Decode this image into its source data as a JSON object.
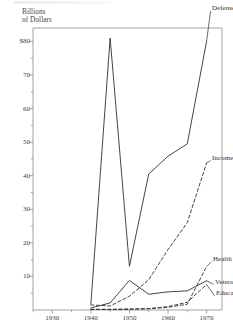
{
  "figure": {
    "axis_title": "Billions\nof Dollars",
    "frame_color": "#8a8a8a",
    "line_color": "#2f2f2f"
  },
  "chart_data": {
    "type": "line",
    "title": "",
    "subtitle": "",
    "xlabel": "",
    "ylabel": "Billions of Dollars",
    "xlim": [
      1925,
      1974
    ],
    "ylim": [
      0,
      84
    ],
    "grid": false,
    "legend_position": "right-inline",
    "x_ticks_major": [
      1930,
      1940,
      1950,
      1960,
      1970
    ],
    "x_ticks_minor": [
      1925,
      1935,
      1945,
      1955,
      1965
    ],
    "x_tick_labels": [
      "1930",
      "1940",
      "1950",
      "1960",
      "1970"
    ],
    "y_ticks": [
      10,
      20,
      30,
      40,
      50,
      60,
      70,
      80
    ],
    "y_tick_labels": [
      "10",
      "20",
      "30",
      "40",
      "50",
      "$80"
    ],
    "y_tick_labels_full": [
      "10",
      "20",
      "30",
      "40",
      "50",
      "60",
      "70",
      "$80"
    ],
    "y_ticks_minor": [
      5,
      15,
      25,
      35,
      45,
      55,
      65,
      75
    ],
    "series": [
      {
        "name": "Defense",
        "style": "solid",
        "label": "Defense",
        "x": [
          1940,
          1945,
          1950,
          1955,
          1960,
          1965,
          1970
        ],
        "values": [
          1.7,
          81.0,
          13.0,
          40.5,
          45.8,
          49.5,
          80.0
        ]
      },
      {
        "name": "Income Security",
        "style": "dashed",
        "label": "Income Security",
        "x": [
          1940,
          1945,
          1950,
          1955,
          1960,
          1965,
          1970
        ],
        "values": [
          1.5,
          1.2,
          4.1,
          9.0,
          18.0,
          26.0,
          43.8
        ]
      },
      {
        "name": "Health",
        "style": "dashed",
        "label": "Health",
        "x": [
          1940,
          1945,
          1950,
          1955,
          1960,
          1965,
          1970
        ],
        "values": [
          0.2,
          0.2,
          0.3,
          0.4,
          0.8,
          1.7,
          13.0
        ]
      },
      {
        "name": "Veterans",
        "style": "solid",
        "label": "Veterans",
        "x": [
          1940,
          1945,
          1950,
          1955,
          1960,
          1965,
          1970
        ],
        "values": [
          0.6,
          2.1,
          8.8,
          4.7,
          5.4,
          5.7,
          8.7
        ]
      },
      {
        "name": "Education",
        "style": "dashed",
        "label": "Education",
        "x": [
          1940,
          1945,
          1950,
          1955,
          1960,
          1965,
          1970
        ],
        "values": [
          0.2,
          0.15,
          0.2,
          0.4,
          1.0,
          2.3,
          7.6
        ]
      }
    ]
  }
}
